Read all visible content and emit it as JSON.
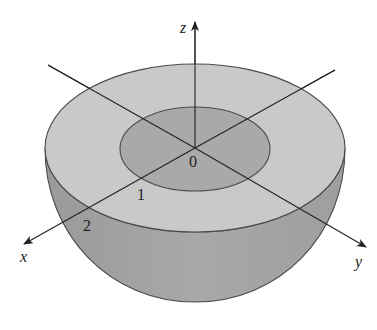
{
  "diagram": {
    "type": "3d-solid",
    "axes": {
      "x": {
        "label": "x"
      },
      "y": {
        "label": "y"
      },
      "z": {
        "label": "z"
      }
    },
    "origin_label": "0",
    "tick_labels": {
      "x1": "1",
      "x2": "2"
    },
    "colors": {
      "top_annulus": "#c9c9c9",
      "inner_recess": "#a9a9a9",
      "outer_side": "#a3a3a3",
      "stroke": "#4a4a4a"
    }
  }
}
